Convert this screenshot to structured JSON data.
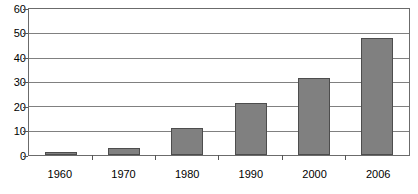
{
  "chart_data": {
    "type": "bar",
    "title": "",
    "subtitle": "",
    "xlabel": "",
    "ylabel": "",
    "categories": [
      "1960",
      "1970",
      "1980",
      "1990",
      "2000",
      "2006"
    ],
    "values": [
      1.3,
      3,
      11,
      21.5,
      31.5,
      48
    ],
    "series": [
      {
        "name": "",
        "values": [
          1.3,
          3,
          11,
          21.5,
          31.5,
          48
        ]
      }
    ],
    "ylim": [
      0,
      60
    ],
    "yticks": [
      0,
      10,
      20,
      30,
      40,
      50,
      60
    ],
    "ytick_labels": [
      "0",
      "10",
      "20",
      "30",
      "40",
      "50",
      "60"
    ],
    "grid": true,
    "grid_axis": "y",
    "legend": false,
    "legend_position": "none",
    "colors": {
      "bar_fill": "#808080",
      "bar_border": "#4d4d4d",
      "gridline": "#808080",
      "axis": "#6b6b6b",
      "background": "#ffffff",
      "text": "#000000"
    }
  }
}
